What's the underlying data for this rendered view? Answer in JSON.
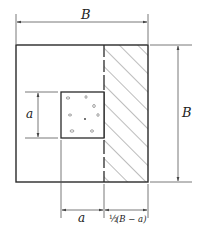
{
  "diagram": {
    "title": "",
    "colors": {
      "line": "#2a2a2a",
      "dim": "#555555",
      "hatch": "#666666"
    },
    "outer_square": {
      "x": 16,
      "y": 45,
      "w": 132,
      "h": 137
    },
    "inner_square": {
      "x": 61,
      "y": 92,
      "w": 43,
      "h": 46
    },
    "hatched_region": {
      "x": 104,
      "y": 45,
      "w": 44,
      "h": 137
    },
    "labels": {
      "top_width": "B",
      "right_height": "B",
      "left_inner": "a",
      "bottom_inner": "a",
      "bottom_strip_prefix": "½",
      "bottom_strip": "(B − a)"
    }
  }
}
